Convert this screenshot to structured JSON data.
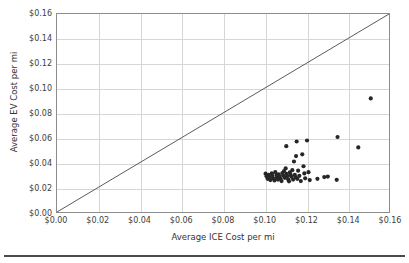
{
  "chart_data": {
    "type": "scatter",
    "title": "",
    "xlabel": "Average ICE Cost per mi",
    "ylabel": "Average EV Cost per mi",
    "xlim": [
      0.0,
      0.16
    ],
    "ylim": [
      0.0,
      0.16
    ],
    "xticks": [
      0.0,
      0.02,
      0.04,
      0.06,
      0.08,
      0.1,
      0.12,
      0.14,
      0.16
    ],
    "yticks": [
      0.0,
      0.02,
      0.04,
      0.06,
      0.08,
      0.1,
      0.12,
      0.14,
      0.16
    ],
    "xtick_labels": [
      "$0.00",
      "$0.02",
      "$0.04",
      "$0.06",
      "$0.08",
      "$0.10",
      "$0.12",
      "$0.14",
      "$0.16"
    ],
    "ytick_labels": [
      "$0.00",
      "$0.02",
      "$0.04",
      "$0.06",
      "$0.08",
      "$0.10",
      "$0.12",
      "$0.14",
      "$0.16"
    ],
    "grid": true,
    "grid_color": "#d6d6d6",
    "frame_color": "#8c8c8c",
    "legend": null,
    "point_color": "#262626",
    "point_radius": 2.1,
    "reference_line": {
      "name": "parity-line",
      "type": "identity",
      "from": [
        0.0,
        0.0
      ],
      "to": [
        0.16,
        0.16
      ],
      "color": "#595959"
    },
    "series": [
      {
        "name": "vehicles",
        "points": [
          [
            0.1005,
            0.031
          ],
          [
            0.101,
            0.0288
          ],
          [
            0.1015,
            0.0268
          ],
          [
            0.102,
            0.03
          ],
          [
            0.1025,
            0.0282
          ],
          [
            0.1028,
            0.0258
          ],
          [
            0.1035,
            0.0312
          ],
          [
            0.1038,
            0.0292
          ],
          [
            0.1042,
            0.0272
          ],
          [
            0.1048,
            0.0255
          ],
          [
            0.1052,
            0.0322
          ],
          [
            0.1058,
            0.0298
          ],
          [
            0.106,
            0.0278
          ],
          [
            0.1065,
            0.0262
          ],
          [
            0.1068,
            0.0305
          ],
          [
            0.1072,
            0.0286
          ],
          [
            0.1078,
            0.0268
          ],
          [
            0.1082,
            0.025
          ],
          [
            0.1086,
            0.0315
          ],
          [
            0.109,
            0.0295
          ],
          [
            0.1094,
            0.033
          ],
          [
            0.1098,
            0.0276
          ],
          [
            0.1102,
            0.0352
          ],
          [
            0.1106,
            0.0308
          ],
          [
            0.111,
            0.029
          ],
          [
            0.1114,
            0.0265
          ],
          [
            0.1118,
            0.0248
          ],
          [
            0.1122,
            0.032
          ],
          [
            0.1126,
            0.03
          ],
          [
            0.113,
            0.0284
          ],
          [
            0.1134,
            0.0338
          ],
          [
            0.1138,
            0.0262
          ],
          [
            0.1142,
            0.0408
          ],
          [
            0.1146,
            0.03
          ],
          [
            0.115,
            0.0282
          ],
          [
            0.1152,
            0.0452
          ],
          [
            0.1155,
            0.057
          ],
          [
            0.1158,
            0.0268
          ],
          [
            0.1105,
            0.0532
          ],
          [
            0.1162,
            0.0334
          ],
          [
            0.1168,
            0.0292
          ],
          [
            0.1175,
            0.025
          ],
          [
            0.1182,
            0.0466
          ],
          [
            0.1188,
            0.037
          ],
          [
            0.1192,
            0.0312
          ],
          [
            0.1196,
            0.0272
          ],
          [
            0.1205,
            0.0578
          ],
          [
            0.1212,
            0.0322
          ],
          [
            0.1218,
            0.0258
          ],
          [
            0.1255,
            0.0268
          ],
          [
            0.1288,
            0.0282
          ],
          [
            0.1305,
            0.0286
          ],
          [
            0.1348,
            0.026
          ],
          [
            0.1352,
            0.0606
          ],
          [
            0.1452,
            0.0522
          ],
          [
            0.1512,
            0.0918
          ]
        ]
      }
    ]
  }
}
